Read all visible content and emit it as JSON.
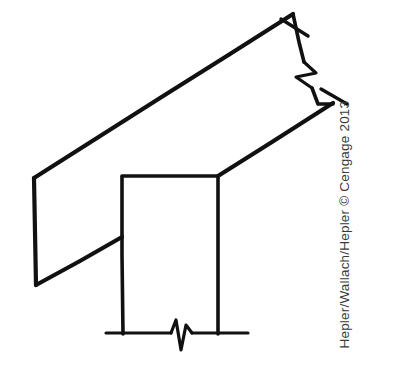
{
  "figure": {
    "width": 401,
    "height": 380,
    "background_color": "#ffffff",
    "ink_color": "#111111"
  },
  "credit": {
    "text": "Hepler/Wallach/Hepler © Cengage 2013",
    "authors": "Hepler/Wallach/Hepler",
    "copyright_symbol": "©",
    "publisher": "Cengage",
    "year": "2013",
    "color": "#3a3a3a",
    "rotation_degrees": -90,
    "reading_direction": "bottom-to-top"
  },
  "drawing": {
    "parts": [
      {
        "name": "sloped-board",
        "label": "Sloped board",
        "description": "Long rectangular board drawn in perspective rising to the upper right, broken at its upper right end",
        "stroke_width": 4.2
      },
      {
        "name": "vertical-post",
        "label": "Vertical post",
        "description": "Rectangular post supporting the sloped board, broken at its base",
        "stroke_width": 3.6
      },
      {
        "name": "ground-line",
        "label": "Ground line",
        "description": "Horizontal base line at the bottom of the post with a break symbol",
        "stroke_width": 3.6
      }
    ],
    "symbols": [
      {
        "name": "break-symbol-board",
        "label": "Break symbol (sloped board)",
        "description": "Zigzag break mark across the upper right end of the sloped board",
        "type": "zigzag-break"
      },
      {
        "name": "break-symbol-ground",
        "label": "Break symbol (ground line)",
        "description": "Zigzag break mark in the horizontal ground line below the post",
        "type": "zigzag-break"
      },
      {
        "name": "end-tick-upper",
        "label": "Upper end tick",
        "description": "Short tick extending past the upper corner of the board end",
        "type": "tick"
      },
      {
        "name": "end-tick-lower",
        "label": "Lower end tick",
        "description": "Short tick extending past the lower corner of the board end",
        "type": "tick"
      }
    ],
    "geometry": {
      "board_top_edge": "M 34,178 L 293,14",
      "board_bottom_edge": "M 36,285 L 122,237 L 218,176 L 333,103",
      "board_left_end": "M 34,178 L 36,285",
      "board_right_end_upper": "M 293,14 L 305,69",
      "board_right_end_lower": "M 314,97 L 333,103",
      "board_right_end_join": "M 305,69 L 314,97",
      "post_left_edge": "M 122,176 L 122,334",
      "post_right_edge": "M 218,176 L 218,334",
      "post_top_edge": "M 122,176 L 218,176",
      "ground_line_left": "M 106,333 L 172,333",
      "ground_line_right": "M 194,333 L 248,333",
      "break_zigzag_ground": "M 172,333 L 177,321 L 182,349 L 187,327 L 191,333",
      "break_zigzag_board": "M 300,58 L 315,75 L 297,78 L 311,93",
      "tick_upper": "M 282,20 L 309,36",
      "tick_lower": "M 322,89 L 347,104"
    }
  }
}
